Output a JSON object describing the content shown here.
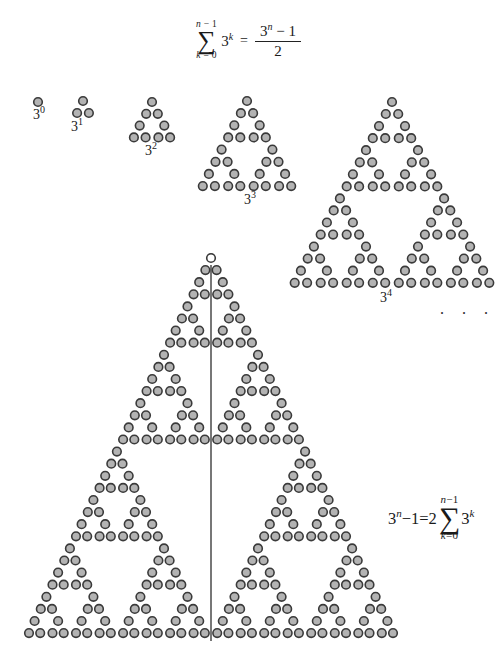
{
  "page": {
    "width": 503,
    "height": 670,
    "background": "#ffffff"
  },
  "style": {
    "circle_fill": "#b3b3b3",
    "circle_stroke": "#3a3a3a",
    "open_circle_fill": "#ffffff",
    "line_color": "#4a4a4a",
    "circle_stroke_width": 1.6,
    "line_width": 1.5
  },
  "top_formula": {
    "sum_upper_var": "n",
    "sum_upper_rest": " − 1",
    "sigma": "∑",
    "sum_lower_var": "k",
    "sum_lower_rest": " = 0",
    "term_base": "3",
    "term_exp": "k",
    "equals": "=",
    "frac_num_base": "3",
    "frac_num_exp": "n",
    "frac_num_rest": " − 1",
    "frac_den": "2"
  },
  "right_formula": {
    "lhs_base": "3",
    "lhs_exp": "n",
    "lhs_rest": "−1=2",
    "sum_upper_var": "n",
    "sum_upper_rest": "−1",
    "sigma": "∑",
    "sum_lower_var": "k",
    "sum_lower_rest": "=0",
    "term_base": "3",
    "term_exp": "k"
  },
  "ellipsis": ". . .",
  "gap_multiplier": 1.05,
  "figures": [
    {
      "id": "power-0",
      "depth": 0,
      "count": 1,
      "apex_x": 38,
      "apex_y": 102,
      "sx": 11.7,
      "sy": 11.9,
      "r": 4.3,
      "label_base": "3",
      "label_exp": "0",
      "label_x": 39,
      "label_y": 105
    },
    {
      "id": "power-1",
      "depth": 1,
      "count": 3,
      "apex_x": 83,
      "apex_y": 101,
      "sx": 11.8,
      "sy": 12.0,
      "r": 4.3,
      "label_base": "3",
      "label_exp": "1",
      "label_x": 77,
      "label_y": 117
    },
    {
      "id": "power-2",
      "depth": 2,
      "count": 9,
      "apex_x": 152,
      "apex_y": 102,
      "sx": 11.7,
      "sy": 11.8,
      "r": 4.3,
      "label_base": "3",
      "label_exp": "2",
      "label_x": 151,
      "label_y": 141
    },
    {
      "id": "power-3",
      "depth": 3,
      "count": 27,
      "apex_x": 247,
      "apex_y": 101,
      "sx": 12.1,
      "sy": 12.15,
      "r": 4.3,
      "label_base": "3",
      "label_exp": "3",
      "label_x": 250,
      "label_y": 190
    },
    {
      "id": "power-4",
      "depth": 4,
      "count": 81,
      "apex_x": 392,
      "apex_y": 102,
      "sx": 12.4,
      "sy": 12.05,
      "r": 4.3,
      "label_base": "3",
      "label_exp": "4",
      "label_x": 386,
      "label_y": 288
    },
    {
      "id": "power-n",
      "depth": 5,
      "count": 243,
      "apex_x": 211,
      "apex_y": 258,
      "sx": 11.2,
      "sy": 12.1,
      "r": 4.3,
      "open_apex": true,
      "line": {
        "x": 211,
        "y1": 265,
        "y2": 641
      }
    }
  ]
}
